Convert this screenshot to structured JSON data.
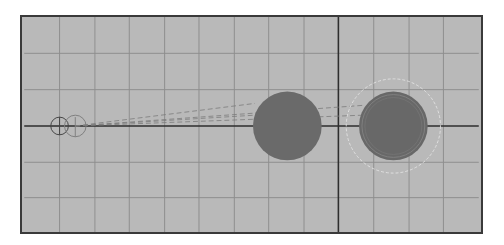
{
  "viewport": {
    "view": "front-orthographic",
    "background": "#b9b9b9",
    "grid_color": "#8e8e8e",
    "axis_color": "#2e2e2e",
    "grid_spacing_px": 35.5
  },
  "objects": [
    {
      "name": "camera",
      "type": "camera",
      "icon": "camera-crosshair-icon"
    },
    {
      "name": "sphere-1",
      "type": "sphere",
      "color": "#6a6a6a"
    },
    {
      "name": "sphere-2",
      "type": "sphere",
      "color": "#686868",
      "selected": true,
      "selection_color": "#e6e6e6"
    }
  ]
}
